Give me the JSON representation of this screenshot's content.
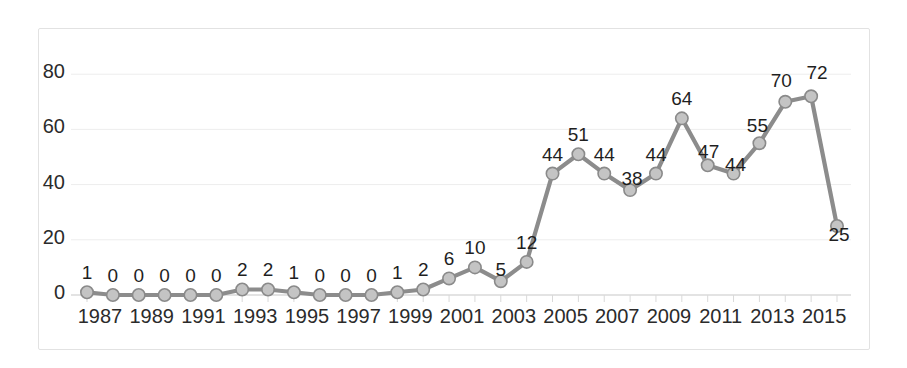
{
  "chart_data": {
    "type": "line",
    "title": "",
    "xlabel": "",
    "ylabel": "",
    "ylim": [
      0,
      88
    ],
    "yticks": [
      0,
      20,
      40,
      60,
      80
    ],
    "grid": true,
    "legend": false,
    "x": [
      1987,
      1988,
      1989,
      1990,
      1991,
      1992,
      1993,
      1994,
      1995,
      1996,
      1997,
      1998,
      1999,
      2000,
      2001,
      2002,
      2003,
      2004,
      2005,
      2006,
      2007,
      2008,
      2009,
      2010,
      2011,
      2012,
      2013,
      2014,
      2015,
      2016
    ],
    "categories": [
      "1987",
      "1988",
      "1989",
      "1990",
      "1991",
      "1992",
      "1993",
      "1994",
      "1995",
      "1996",
      "1997",
      "1998",
      "1999",
      "2000",
      "2001",
      "2002",
      "2003",
      "2004",
      "2005",
      "2006",
      "2007",
      "2008",
      "2009",
      "2010",
      "2011",
      "2012",
      "2013",
      "2014",
      "2015",
      "2016"
    ],
    "values": [
      1,
      0,
      0,
      0,
      0,
      0,
      2,
      2,
      1,
      0,
      0,
      0,
      1,
      2,
      6,
      10,
      5,
      12,
      44,
      51,
      44,
      38,
      44,
      64,
      47,
      44,
      55,
      70,
      72,
      25
    ],
    "point_labels": [
      "1",
      "0",
      "0",
      "0",
      "0",
      "0",
      "2",
      "2",
      "1",
      "0",
      "0",
      "0",
      "1",
      "2",
      "6",
      "10",
      "5",
      "12",
      "44",
      "51",
      "44",
      "38",
      "44",
      "64",
      "47",
      "44",
      "55",
      "70",
      "72",
      "25"
    ],
    "xtick_labels": [
      "1987",
      "1989",
      "1991",
      "1993",
      "1995",
      "1997",
      "1999",
      "2001",
      "2003",
      "2005",
      "2007",
      "2009",
      "2011",
      "2013",
      "2015"
    ],
    "xtick_values": [
      1987,
      1989,
      1991,
      1993,
      1995,
      1997,
      1999,
      2001,
      2003,
      2005,
      2007,
      2009,
      2011,
      2013,
      2015
    ],
    "ytick_labels": [
      "0",
      "20",
      "40",
      "60",
      "80"
    ],
    "colors": {
      "line": "#8c8c8c",
      "marker_fill": "#c4c4c4",
      "marker_stroke": "#8a8a8a",
      "grid": "#ededed",
      "axis": "#d9d9d9",
      "border": "#e2e2e2",
      "text": "#2b2b2b",
      "background": "#ffffff"
    }
  }
}
